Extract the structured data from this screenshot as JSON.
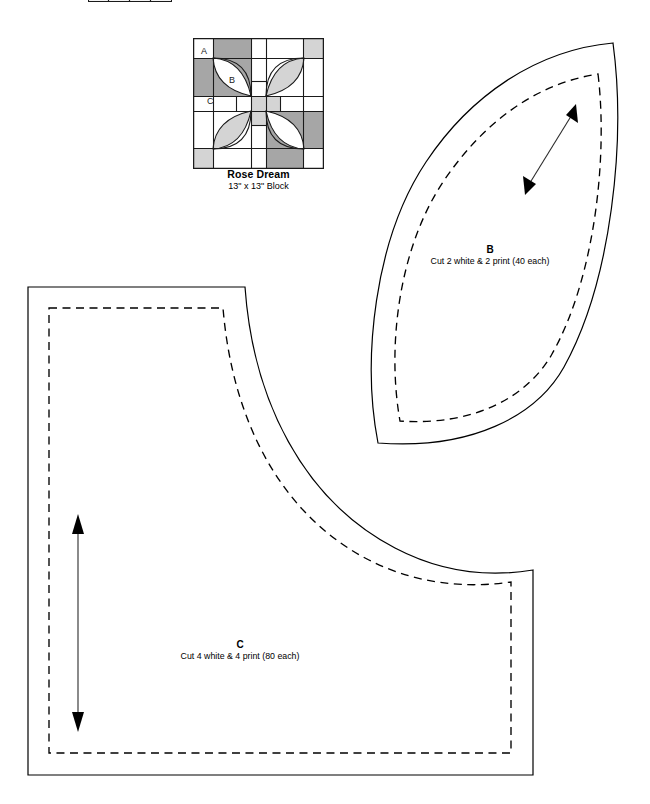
{
  "page": {
    "kind": "quilt-pattern-template-sheet",
    "background_color": "#ffffff",
    "ink_color": "#000000",
    "width": 650,
    "height": 804
  },
  "block_diagram": {
    "title": "Rose Dream",
    "size_label": "13\" x 13\" Block",
    "patch_labels": [
      {
        "id": "A",
        "text": "A",
        "x": 13,
        "y": 16
      },
      {
        "id": "B",
        "text": "B",
        "x": 40,
        "y": 45
      },
      {
        "id": "C",
        "text": "C",
        "x": 18,
        "y": 66
      }
    ],
    "colors": {
      "white": "#ffffff",
      "print_dark": "#a6a6a6",
      "print_light": "#d4d4d4",
      "outline": "#1a1a1a"
    },
    "grid": {
      "columns": 4,
      "rows": 4,
      "side_px": 131
    }
  },
  "templates": [
    {
      "id": "B",
      "letter": "B",
      "cut_instruction": "Cut 2 white & 2 print (40 each)",
      "shape": "lens",
      "has_seam_allowance_dashed": true,
      "grainline": "diagonal-double-arrow"
    },
    {
      "id": "C",
      "letter": "C",
      "cut_instruction": "Cut 4 white & 4 print (80 each)",
      "shape": "L-with-concave-curve",
      "has_seam_allowance_dashed": true,
      "grainline": "vertical-double-arrow"
    }
  ],
  "top_cropped_block": {
    "present": true,
    "description": "bottom sliver of a preceding block diagram, cropped by page edge"
  }
}
